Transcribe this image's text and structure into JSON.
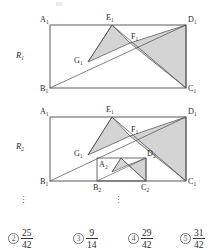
{
  "figure": {
    "caption_fragment": "",
    "rectangles": [
      {
        "name": "R1",
        "label": "R",
        "label_sub": "1",
        "vertices": {
          "A": {
            "label": "A",
            "sub": "1",
            "x": 50,
            "y": 25
          },
          "B": {
            "label": "B",
            "sub": "1",
            "x": 50,
            "y": 88
          },
          "C": {
            "label": "C",
            "sub": "1",
            "x": 186,
            "y": 88
          },
          "D": {
            "label": "D",
            "sub": "1",
            "x": 186,
            "y": 25
          },
          "E": {
            "label": "E",
            "sub": "1",
            "x": 112,
            "y": 25
          },
          "F": {
            "label": "F",
            "sub": "1",
            "x": 130,
            "y": 43
          },
          "G": {
            "label": "G",
            "sub": "1",
            "x": 88,
            "y": 62
          }
        },
        "shaded_triangles": [
          {
            "name": "triangle-E1-G1-F1",
            "points": "112,25 88,62 130,43"
          },
          {
            "name": "triangle-F1-D1-C1",
            "points": "130,43 186,25 186,88"
          }
        ],
        "lines": [
          {
            "name": "diagonal-B1-D1",
            "x1": 50,
            "y1": 88,
            "x2": 186,
            "y2": 25
          },
          {
            "name": "segment-E1-G1",
            "x1": 112,
            "y1": 25,
            "x2": 88,
            "y2": 62
          },
          {
            "name": "segment-E1-C1",
            "x1": 112,
            "y1": 25,
            "x2": 186,
            "y2": 88
          }
        ]
      },
      {
        "name": "R2",
        "label": "R",
        "label_sub": "2",
        "vertices": {
          "A": {
            "label": "A",
            "sub": "1",
            "x": 50,
            "y": 117
          },
          "B": {
            "label": "B",
            "sub": "1",
            "x": 50,
            "y": 181
          },
          "C": {
            "label": "C",
            "sub": "1",
            "x": 186,
            "y": 181
          },
          "D": {
            "label": "D",
            "sub": "1",
            "x": 186,
            "y": 117
          },
          "E": {
            "label": "E",
            "sub": "1",
            "x": 112,
            "y": 117
          },
          "F": {
            "label": "F",
            "sub": "1",
            "x": 130,
            "y": 136
          },
          "G": {
            "label": "G",
            "sub": "1",
            "x": 88,
            "y": 155
          }
        },
        "inner_vertices": {
          "A2": {
            "label": "A",
            "sub": "2",
            "x": 97,
            "y": 158
          },
          "B2": {
            "label": "B",
            "sub": "2",
            "x": 97,
            "y": 181
          },
          "C2": {
            "label": "C",
            "sub": "2",
            "x": 146,
            "y": 181
          },
          "D2": {
            "label": "D",
            "sub": "2",
            "x": 146,
            "y": 158
          }
        },
        "inner_points": {
          "E2": {
            "x": 121,
            "y": 158
          },
          "F2": {
            "x": 128,
            "y": 165
          },
          "G2": {
            "x": 112,
            "y": 172
          }
        },
        "shaded_triangles": [
          {
            "name": "triangle-E1-G1-F1",
            "points": "112,117 88,155 130,136"
          },
          {
            "name": "triangle-F1-D1-C1",
            "points": "130,136 186,117 186,181"
          },
          {
            "name": "triangle-E2-G2-F2",
            "points": "121,158 112,172 128,165"
          },
          {
            "name": "triangle-F2-D2-C2",
            "points": "128,165 146,158 146,181"
          }
        ],
        "lines": [
          {
            "name": "diagonal-B1-D1",
            "x1": 50,
            "y1": 181,
            "x2": 186,
            "y2": 117
          },
          {
            "name": "segment-E1-G1",
            "x1": 112,
            "y1": 117,
            "x2": 88,
            "y2": 155
          },
          {
            "name": "segment-E1-C1",
            "x1": 112,
            "y1": 117,
            "x2": 186,
            "y2": 181
          },
          {
            "name": "diagonal-B2-D2",
            "x1": 97,
            "y1": 181,
            "x2": 146,
            "y2": 158
          },
          {
            "name": "segment-E2-G2",
            "x1": 121,
            "y1": 158,
            "x2": 112,
            "y2": 172
          },
          {
            "name": "segment-E2-C2",
            "x1": 121,
            "y1": 158,
            "x2": 146,
            "y2": 181
          }
        ]
      }
    ],
    "ellipses": [
      {
        "name": "ellipsis-left",
        "glyph": "⋮",
        "x": 20,
        "y": 200
      },
      {
        "name": "ellipsis-right",
        "glyph": "⋮",
        "x": 115,
        "y": 200
      }
    ],
    "shade_color": "#d4d4d4",
    "line_color": "#4a4a4a"
  },
  "options": [
    {
      "marker": "2",
      "numerator": "25",
      "denominator": "42",
      "x": 8
    },
    {
      "marker": "3",
      "numerator": "9",
      "denominator": "14",
      "x": 73
    },
    {
      "marker": "4",
      "numerator": "29",
      "denominator": "42",
      "x": 128
    },
    {
      "marker": "5",
      "numerator": "31",
      "denominator": "42",
      "x": 180
    }
  ]
}
